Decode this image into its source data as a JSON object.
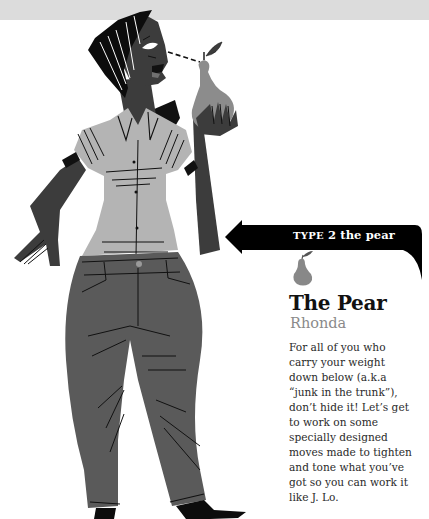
{
  "banner": {
    "type_word": "TYPE",
    "type_number": "2",
    "type_name": "the pear"
  },
  "profile": {
    "icon": "pear-icon",
    "title": "The Pear",
    "name": "Rhonda",
    "description_lines": [
      "For all of you who",
      "carry your weight",
      "down below (a.k.a",
      "“junk in the trunk”),",
      "don’t hide it! Let’s get",
      "to work on some",
      "specially designed",
      "moves made to tighten",
      "and tone what you’ve",
      "got so you can work it",
      "like J. Lo."
    ]
  },
  "colors": {
    "top_band": "#dcdcdc",
    "banner": "#000000",
    "skin": "#3c3c3c",
    "shirt": "#b4b4b4",
    "jeans": "#5a5a5a",
    "pear": "#8c8c8c",
    "subtitle": "#8a8a8a"
  }
}
